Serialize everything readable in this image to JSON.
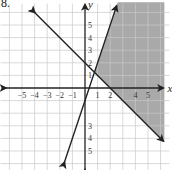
{
  "problem_label": "8.",
  "chart_data": {
    "type": "line",
    "title": "",
    "xlabel": "x",
    "ylabel": "y",
    "xlim": [
      -6,
      6
    ],
    "ylim": [
      -6,
      6
    ],
    "grid": true,
    "x_ticks": [
      "-5",
      "-4",
      "-3",
      "-2",
      "-1",
      "1",
      "2",
      "4",
      "5"
    ],
    "y_ticks": [
      "5",
      "4",
      "3",
      "2",
      "1",
      "3",
      "4",
      "5"
    ],
    "y_tick_values": [
      5,
      4,
      3,
      2,
      1,
      -3,
      -4,
      -5
    ],
    "x_tick_values": [
      -5,
      -4,
      -3,
      -2,
      -1,
      1,
      2,
      4,
      5
    ],
    "series": [
      {
        "name": "line-decreasing",
        "equation": "y = -x + 2",
        "slope": -1,
        "intercept": 2
      },
      {
        "name": "line-increasing",
        "equation": "y = 3x - 1",
        "slope": 3,
        "intercept": -1
      }
    ],
    "shaded_region": "y >= -x + 2 and y <= 3x - 1",
    "colors": {
      "shade": "#a9a9a9",
      "grid": "#c8c8c8",
      "axis": "#222222"
    }
  }
}
